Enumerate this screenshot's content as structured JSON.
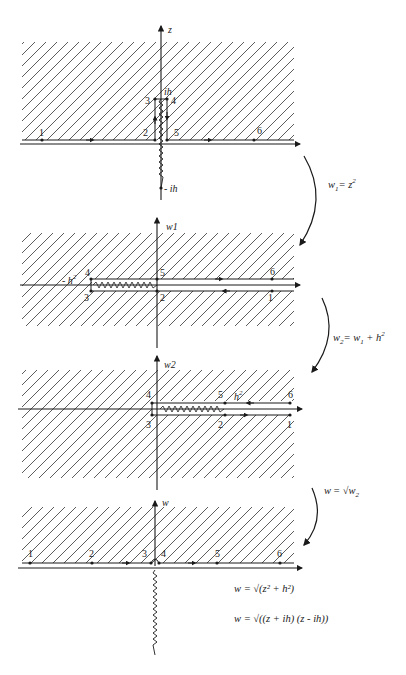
{
  "figure": {
    "panels": [
      {
        "id": "z",
        "axis_label": "z",
        "points": [
          "1",
          "2",
          "3",
          "4",
          "5",
          "6"
        ],
        "marks": [
          "ih",
          "-ih"
        ]
      },
      {
        "id": "w1",
        "axis_label": "w1",
        "points": [
          "1",
          "2",
          "3",
          "4",
          "5",
          "6"
        ],
        "marks": [
          "-h²"
        ]
      },
      {
        "id": "w2",
        "axis_label": "w2",
        "points": [
          "1",
          "2",
          "3",
          "4",
          "5",
          "6"
        ],
        "marks": [
          "h²"
        ]
      },
      {
        "id": "w",
        "axis_label": "w",
        "points": [
          "1",
          "2",
          "3",
          "4",
          "5",
          "6"
        ],
        "marks": []
      }
    ],
    "maps": [
      {
        "lhs": "w",
        "lhs_sub": "1",
        "rhs": "= z",
        "rhs_sup": "2"
      },
      {
        "lhs": "w",
        "lhs_sub": "2",
        "rhs": "= w",
        "rhs_sub": "1",
        "rhs2": " + h",
        "rhs2_sup": "2"
      },
      {
        "lhs": "w",
        "rhs": "= √w",
        "rhs_sub": "2"
      }
    ],
    "final_equations": [
      "w = √(z² + h²)",
      "w = √((z + ih) (z - ih))"
    ],
    "labels": {
      "ih": "ih",
      "neg_ih": "- ih",
      "neg_h2": "- h",
      "h2": "h",
      "sup2": "2"
    }
  }
}
